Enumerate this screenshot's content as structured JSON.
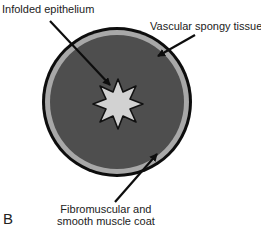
{
  "figure": {
    "panel_letter": "B",
    "labels": {
      "infolded_epithelium": "Infolded epithelium",
      "vascular_spongy_tissue": "Vascular spongy tissue",
      "fibromuscular_line1": "Fibromuscular and",
      "fibromuscular_line2": "smooth muscle coat"
    },
    "colors": {
      "outer_ring": "#0d0d0d",
      "muscle_coat": "#a8a8a8",
      "spongy_tissue": "#4e4e4e",
      "epithelium": "#d2d2d2",
      "arrow": "#0d0d0d"
    },
    "star_points": 8
  }
}
